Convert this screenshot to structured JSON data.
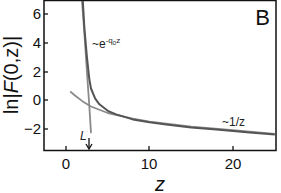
{
  "chart_data": {
    "type": "line",
    "title": "",
    "panel_label": "B",
    "xlabel": "z",
    "ylabel": "ln|F(0,z)|",
    "xlim": [
      -2.6,
      25.2
    ],
    "ylim": [
      -3.5,
      7
    ],
    "xticks": [
      0,
      10,
      20
    ],
    "xtick_labels": [
      "0",
      "10",
      "20"
    ],
    "yticks": [
      -2,
      0,
      2,
      4,
      6
    ],
    "ytick_labels": [
      "−2",
      "0",
      "2",
      "4",
      "6"
    ],
    "grid": false,
    "legend": null,
    "series": [
      {
        "name": "ln|F(0,z)| (full)",
        "color": "#555555",
        "x": [
          2.0,
          2.2,
          2.5,
          2.8,
          3.0,
          3.5,
          4.0,
          5.0,
          6.0,
          8.0,
          10.0,
          12.0,
          15.0,
          18.0,
          20.0,
          22.0,
          25.0
        ],
        "y": [
          7.0,
          5.0,
          3.0,
          1.4,
          0.8,
          0.1,
          -0.3,
          -0.75,
          -1.0,
          -1.35,
          -1.55,
          -1.7,
          -1.9,
          -2.05,
          -2.15,
          -2.25,
          -2.4
        ]
      },
      {
        "name": "~e^{-q0 z} asymptote",
        "color": "#8a8a8a",
        "x": [
          1.9,
          2.2,
          2.5,
          2.8,
          3.0
        ],
        "y": [
          7.0,
          4.6,
          2.0,
          -0.5,
          -2.3
        ]
      },
      {
        "name": "~1/z asymptote",
        "color": "#8a8a8a",
        "x": [
          0.5,
          1.0,
          2.0,
          3.0,
          5.0,
          8.0,
          10.0,
          15.0,
          20.0,
          25.0
        ],
        "y": [
          0.6,
          0.35,
          -0.1,
          -0.45,
          -0.9,
          -1.3,
          -1.5,
          -1.85,
          -2.1,
          -2.35
        ]
      }
    ],
    "annotations": [
      {
        "text": "~e^{-q₀z}",
        "x": 4.8,
        "y": 4.0
      },
      {
        "text": "~1/z",
        "x": 19.5,
        "y": -1.6
      },
      {
        "text": "L",
        "x": 2.6,
        "y": -2.6,
        "arrow": "down",
        "arrow_x": 2.8
      }
    ]
  },
  "labels": {
    "panel": "B",
    "xlabel": "z",
    "ylabel_prefix": "ln|",
    "ylabel_F": "F",
    "ylabel_suffix": "(0,z)|",
    "annot_exp_main": "~e",
    "annot_exp_sup": "-q",
    "annot_exp_sub": "0",
    "annot_exp_z": "z",
    "annot_inv": "~1/z",
    "annot_L": "L",
    "x0": "0",
    "x10": "10",
    "x20": "20",
    "ym2": "−2",
    "y0": "0",
    "y2": "2",
    "y4": "4",
    "y6": "6"
  }
}
